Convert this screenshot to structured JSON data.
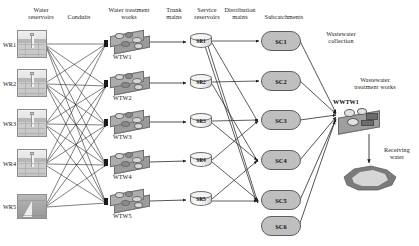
{
  "diagram": {
    "headers": [
      {
        "id": "water-reservoirs",
        "label": "Water\nreservoirs"
      },
      {
        "id": "conduits",
        "label": "Conduits"
      },
      {
        "id": "water-treatment-works",
        "label": "Water treatment\nworks"
      },
      {
        "id": "trunk-mains",
        "label": "Trunk\nmains"
      },
      {
        "id": "service-reservoirs",
        "label": "Service\nreservoirs"
      },
      {
        "id": "distribution-mains",
        "label": "Distribution\nmains"
      },
      {
        "id": "subcatchments",
        "label": "Subcatchments"
      },
      {
        "id": "wastewater-collection",
        "label": "Wastewater\ncollection"
      },
      {
        "id": "wastewater-treatment-works",
        "label": "Wastewater\ntreatment works"
      },
      {
        "id": "receiving-water",
        "label": "Receiving\nwater"
      }
    ],
    "header_text": {
      "water_reservoirs_l1": "Water",
      "water_reservoirs_l2": "reservoirs",
      "conduits": "Conduits",
      "wtw_l1": "Water treatment",
      "wtw_l2": "works",
      "trunk_l1": "Trunk",
      "trunk_l2": "mains",
      "service_l1": "Service",
      "service_l2": "reservoirs",
      "dist_l1": "Distribution",
      "dist_l2": "mains",
      "subcatchments": "Subcatchments",
      "ww_coll_l1": "Wastewater",
      "ww_coll_l2": "collection",
      "wwtw_l1": "Wastewater",
      "wwtw_l2": "treatment works",
      "recv_l1": "Receiving",
      "recv_l2": "water"
    },
    "water_reservoirs": [
      {
        "id": "WR1",
        "label": "WR1",
        "style": "tank"
      },
      {
        "id": "WR2",
        "label": "WR2",
        "style": "tank"
      },
      {
        "id": "WR3",
        "label": "WR3",
        "style": "tank"
      },
      {
        "id": "WR4",
        "label": "WR4",
        "style": "tank"
      },
      {
        "id": "WR5",
        "label": "WR5",
        "style": "solid"
      }
    ],
    "water_treatment_works": [
      {
        "id": "WTW1",
        "label": "WTW1"
      },
      {
        "id": "WTW2",
        "label": "WTW2"
      },
      {
        "id": "WTW3",
        "label": "WTW3"
      },
      {
        "id": "WTW4",
        "label": "WTW4"
      },
      {
        "id": "WTW5",
        "label": "WTW5"
      }
    ],
    "service_reservoirs": [
      {
        "id": "SR1",
        "label": "SR1"
      },
      {
        "id": "SR2",
        "label": "SR2"
      },
      {
        "id": "SR3",
        "label": "SR3"
      },
      {
        "id": "SR4",
        "label": "SR4"
      },
      {
        "id": "SR5",
        "label": "SR5"
      }
    ],
    "subcatchments": [
      {
        "id": "SC1",
        "label": "SC1"
      },
      {
        "id": "SC2",
        "label": "SC2"
      },
      {
        "id": "SC3",
        "label": "SC3"
      },
      {
        "id": "SC4",
        "label": "SC4"
      },
      {
        "id": "SC5",
        "label": "SC5"
      },
      {
        "id": "SC6",
        "label": "SC6"
      }
    ],
    "wastewater_treatment_works": [
      {
        "id": "WWTW1",
        "label": "WWTW1"
      }
    ],
    "receiving_water": {
      "id": "RW1",
      "label": ""
    },
    "colors": {
      "line": "#2a2a2a",
      "node_fill": "#bfbfbf",
      "node_stroke": "#5d5d5d",
      "icon_light": "#ededed",
      "icon_mid": "#adadad",
      "icon_dark": "#6d6d6d",
      "lake_outer": "#7a7a7a",
      "lake_inner": "#d4d4d4",
      "background": "#ffffff"
    },
    "edge_counts": {
      "conduits": 22,
      "trunk_mains": 5,
      "distribution_mains": 10,
      "wastewater_collection": 6,
      "outfall": 1
    }
  }
}
